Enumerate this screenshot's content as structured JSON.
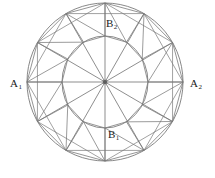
{
  "figure": {
    "background_color": "#ffffff",
    "stroke_color": "#7a7a7a",
    "stroke_color_dark": "#5c5c5c",
    "text_color": "#1a1a1a",
    "labels": {
      "left": "A",
      "left_sub": "1",
      "right": "A",
      "right_sub": "2",
      "top": "B",
      "top_sub": "2",
      "bottom": "B",
      "bottom_sub": "1"
    },
    "geometry": {
      "center_x": 105,
      "center_y": 82,
      "outer_rx": 78,
      "outer_ry": 79,
      "inner_rx": 43,
      "inner_ry": 46,
      "spoke_count": 12,
      "spoke_step_degrees": 30,
      "center_dot_radius": 2
    }
  }
}
